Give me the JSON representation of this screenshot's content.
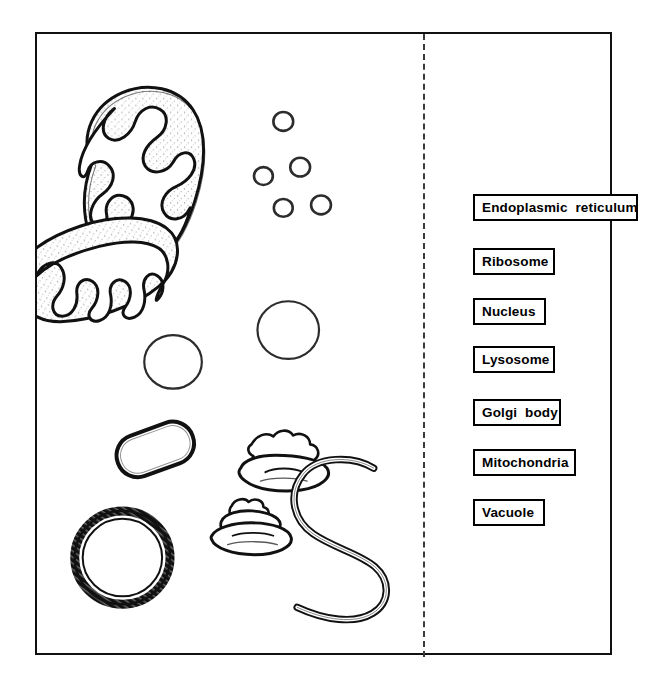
{
  "worksheet": {
    "title": "Cell organelle identification worksheet",
    "background_color": "#ffffff",
    "ink_color": "#111111",
    "frame": {
      "x": 35,
      "y": 32,
      "width": 577,
      "height": 623,
      "border_px": 2
    },
    "divider": {
      "name": "dashed-divider",
      "orientation": "vertical",
      "x": 422,
      "style": "dashed",
      "color": "#3a3a3a"
    }
  },
  "labels": [
    {
      "id": "endoplasmic-reticulum",
      "text": "Endoplasmic  reticulum",
      "x": 36,
      "y": 160,
      "width": 165
    },
    {
      "id": "ribosome",
      "text": "Ribosome",
      "x": 36,
      "y": 214,
      "width": 82
    },
    {
      "id": "nucleus",
      "text": "Nucleus",
      "x": 36,
      "y": 264,
      "width": 73
    },
    {
      "id": "lysosome",
      "text": "Lysosome",
      "x": 36,
      "y": 312,
      "width": 82
    },
    {
      "id": "golgi-body",
      "text": "Golgi  body",
      "x": 36,
      "y": 365,
      "width": 88
    },
    {
      "id": "mitochondria",
      "text": "Mitochondria",
      "x": 36,
      "y": 415,
      "width": 103
    },
    {
      "id": "vacuole",
      "text": "Vacuole",
      "x": 36,
      "y": 465,
      "width": 72
    }
  ],
  "organelles": [
    {
      "id": "mitochondrion-upper",
      "name": "mitochondrion",
      "count": 1
    },
    {
      "id": "mitochondrion-lower",
      "name": "mitochondrion",
      "count": 1
    },
    {
      "id": "ribosome-cluster",
      "name": "ribosome",
      "count": 5
    },
    {
      "id": "lysosome-left",
      "name": "lysosome",
      "count": 1
    },
    {
      "id": "lysosome-right",
      "name": "lysosome",
      "count": 1
    },
    {
      "id": "vacuole",
      "name": "vacuole",
      "count": 1
    },
    {
      "id": "golgi-body-upper",
      "name": "golgi-body",
      "count": 1
    },
    {
      "id": "golgi-body-lower",
      "name": "golgi-body",
      "count": 1
    },
    {
      "id": "nucleus",
      "name": "nucleus",
      "count": 1
    },
    {
      "id": "endoplasmic-reticulum",
      "name": "endoplasmic-reticulum",
      "count": 1
    }
  ]
}
